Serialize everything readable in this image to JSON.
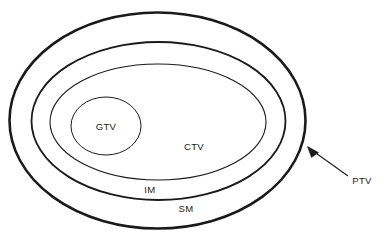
{
  "diagram": {
    "background_color": "#ffffff",
    "stroke_color": "#1a1a1a",
    "label_color": "#1a1a1a",
    "volumes": [
      {
        "id": "ptv",
        "label": "PTV",
        "shape": "ellipse",
        "cx": 157.5,
        "cy": 120.5,
        "rx": 148,
        "ry": 108,
        "stroke_width": 2.6,
        "label_x": 362,
        "label_y": 181,
        "label_anchor": "middle",
        "has_leader_arrow": true
      },
      {
        "id": "sm",
        "label": "SM",
        "shape": "ellipse",
        "cx": 158.5,
        "cy": 121,
        "rx": 127,
        "ry": 79,
        "stroke_width": 1.8,
        "label_x": 186,
        "label_y": 209,
        "label_anchor": "middle",
        "has_leader_arrow": false
      },
      {
        "id": "im",
        "label": "IM",
        "shape": "ellipse",
        "cx": 158,
        "cy": 122,
        "rx": 108,
        "ry": 58,
        "stroke_width": 1.1,
        "label_x": 150,
        "label_y": 190,
        "label_anchor": "middle",
        "has_leader_arrow": false
      },
      {
        "id": "ctv",
        "label": "CTV",
        "shape": "ellipse",
        "cx": 158,
        "cy": 122,
        "rx": 108,
        "ry": 58,
        "stroke_width": 0,
        "label_x": 194,
        "label_y": 147,
        "label_anchor": "middle",
        "has_leader_arrow": false
      },
      {
        "id": "gtv",
        "label": "GTV",
        "shape": "circle",
        "cx": 106,
        "cy": 126,
        "rx": 35,
        "ry": 29,
        "stroke_width": 1.0,
        "label_x": 106,
        "label_y": 127,
        "label_anchor": "middle",
        "has_leader_arrow": false
      }
    ],
    "leader": {
      "name": "ptv-leader-arrow",
      "line_x1": 348,
      "line_y1": 176,
      "line_x2": 313,
      "line_y2": 151,
      "stroke_width": 1.1,
      "arrow_tip_x": 307.5,
      "arrow_tip_y": 146.5,
      "arrow_points": "307.5,146.5 318.5,152.5 311.5,157.5"
    }
  }
}
